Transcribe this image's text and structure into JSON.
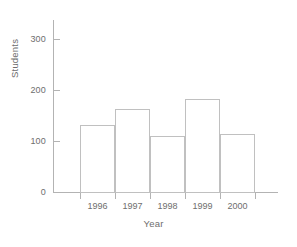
{
  "chart_data": {
    "type": "bar",
    "title": "",
    "categories": [
      "1996",
      "1997",
      "1998",
      "1999",
      "2000"
    ],
    "values": [
      138,
      170,
      115,
      190,
      120
    ],
    "xlabel": "Year",
    "ylabel": "Students",
    "ylim": [
      0,
      350
    ],
    "yticks": [
      0,
      100,
      200,
      300
    ],
    "ytick_labels": [
      "0",
      "100",
      "200",
      "300"
    ],
    "grid": false,
    "legend": false,
    "bar_style": {
      "fill": "none",
      "edge_color": "#c0c0c0",
      "axis_color": "#b3b3b3",
      "text_color": "#6e6e6e"
    }
  }
}
